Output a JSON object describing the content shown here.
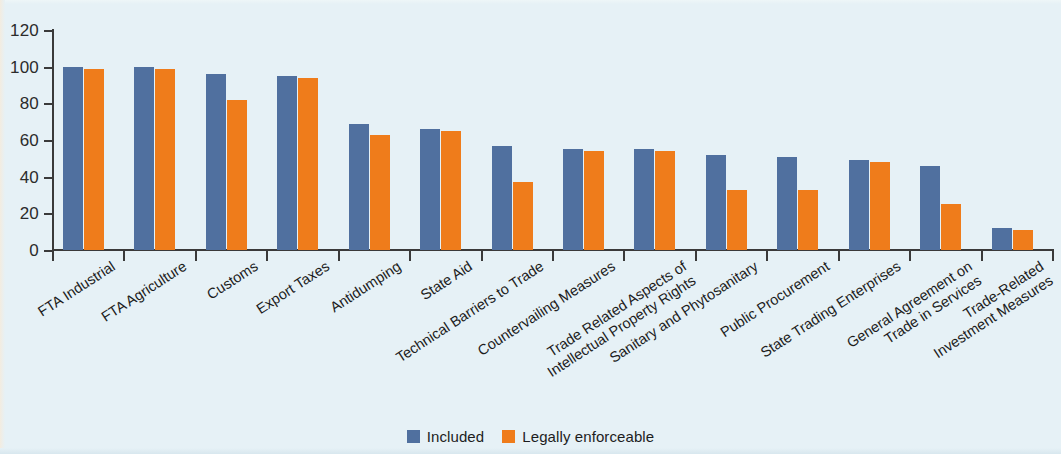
{
  "chart_data": {
    "type": "bar",
    "title": "",
    "subtitle": "",
    "xlabel": "",
    "ylabel": "",
    "ylim": [
      0,
      120
    ],
    "yticks": [
      0,
      20,
      40,
      60,
      80,
      100,
      120
    ],
    "grid": false,
    "legend_position": "bottom-center",
    "categories": [
      "FTA Industrial",
      "FTA Agriculture",
      "Customs",
      "Export Taxes",
      "Antidumping",
      "State Aid",
      "Technical Barriers to Trade",
      "Countervailing Measures",
      "Trade Related Aspects of\nIntellectual Property Rights",
      "Sanitary and Phytosanitary",
      "Public Procurement",
      "State Trading Enterprises",
      "General Agreement on\nTrade in Services",
      "Trade-Related\nInvestment Measures"
    ],
    "series": [
      {
        "name": "Included",
        "color": "#50709f",
        "values": [
          100,
          100,
          96,
          95,
          69,
          66,
          57,
          55,
          55,
          52,
          51,
          49,
          46,
          12
        ]
      },
      {
        "name": "Legally enforceable",
        "color": "#ef7c1b",
        "values": [
          99,
          99,
          82,
          94,
          63,
          65,
          37,
          54,
          54,
          33,
          33,
          48,
          25,
          11
        ]
      }
    ]
  },
  "legend": {
    "items": [
      {
        "label": "Included",
        "color": "#50709f"
      },
      {
        "label": "Legally enforceable",
        "color": "#ef7c1b"
      }
    ]
  },
  "colors": {
    "background": "#e6f1f6",
    "axis": "#3a3a3a",
    "text": "#1d1d1d",
    "included": "#50709f",
    "enforceable": "#ef7c1b"
  }
}
